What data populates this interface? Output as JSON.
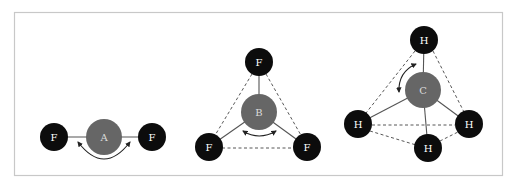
{
  "figure": {
    "molecules": [
      {
        "name": "linear",
        "central_atom": "A",
        "outer_atoms": [
          "F",
          "F"
        ]
      },
      {
        "name": "trigonal-planar",
        "central_atom": "B",
        "outer_atoms": [
          "F",
          "F",
          "F"
        ]
      },
      {
        "name": "tetrahedral",
        "central_atom": "C",
        "outer_atoms": [
          "H",
          "H",
          "H",
          "H"
        ]
      }
    ],
    "colors": {
      "outer_atom": "#0c0c0c",
      "central_atom": "#666666",
      "label": "#ffffff",
      "frame": "#c8c8c8"
    }
  }
}
